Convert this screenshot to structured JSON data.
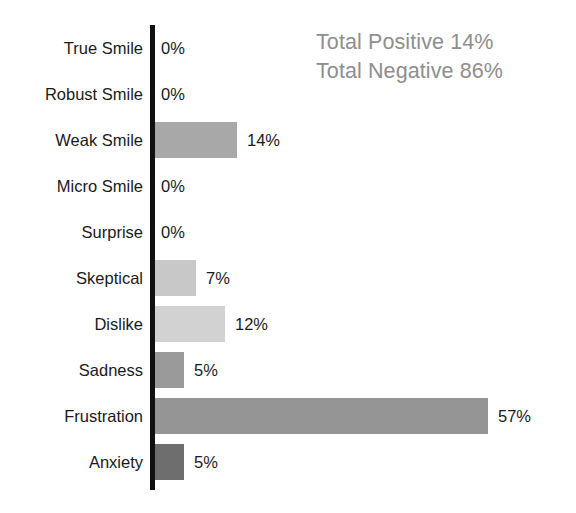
{
  "annotation": {
    "positive_line": "Total Positive 14%",
    "negative_line": "Total Negative 86%",
    "color": "#8e8e8e"
  },
  "axis": {
    "color": "#111111"
  },
  "chart_data": {
    "type": "bar",
    "orientation": "horizontal",
    "title": "",
    "subtitle": "",
    "xlabel": "",
    "ylabel": "",
    "grid": false,
    "legend": "none",
    "xlim": [
      0,
      60
    ],
    "value_suffix": "%",
    "px_per_unit": 5.85,
    "categories": [
      "True Smile",
      "Robust Smile",
      "Weak Smile",
      "Micro Smile",
      "Surprise",
      "Skeptical",
      "Dislike",
      "Sadness",
      "Frustration",
      "Anxiety"
    ],
    "values": [
      0,
      0,
      14,
      0,
      0,
      7,
      12,
      5,
      57,
      5
    ],
    "value_labels": [
      "0%",
      "0%",
      "14%",
      "0%",
      "0%",
      "7%",
      "12%",
      "5%",
      "57%",
      "5%"
    ],
    "bar_colors": [
      "#ffffff",
      "#ffffff",
      "#a8a8a8",
      "#ffffff",
      "#ffffff",
      "#c8c8c8",
      "#d2d2d2",
      "#9a9a9a",
      "#959595",
      "#6e6e6e"
    ],
    "annotations": [
      "Total Positive 14%",
      "Total Negative 86%"
    ]
  }
}
